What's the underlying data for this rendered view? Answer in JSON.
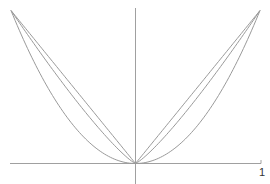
{
  "chart_data": {
    "type": "line",
    "title": "",
    "xlabel": "",
    "ylabel": "",
    "xlim": [
      -1,
      1
    ],
    "ylim": [
      0,
      1
    ],
    "grid": false,
    "legend": null,
    "tick_labels": {
      "x": [
        "1"
      ]
    },
    "series": [
      {
        "name": "|x|",
        "exponent": 1,
        "x": [
          -1,
          -0.5,
          0,
          0.5,
          1
        ],
        "values": [
          1,
          0.5,
          0,
          0.5,
          1
        ]
      },
      {
        "name": "|x|^1.2",
        "exponent": 1.2,
        "x": [
          -1,
          -0.5,
          0,
          0.5,
          1
        ],
        "values": [
          1,
          0.435,
          0,
          0.435,
          1
        ]
      },
      {
        "name": "x^2",
        "exponent": 2,
        "x": [
          -1,
          -0.5,
          0,
          0.5,
          1
        ],
        "values": [
          1,
          0.25,
          0,
          0.25,
          1
        ]
      }
    ],
    "colors": {
      "axis": "#a0a0a0",
      "curve": "#9a9a9a"
    }
  },
  "labels": {
    "x_tick_one": "1"
  }
}
